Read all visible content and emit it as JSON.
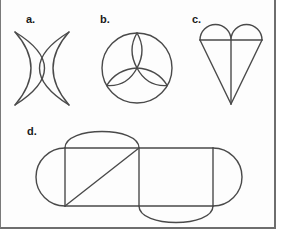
{
  "figures": [
    {
      "id": "a",
      "label": "a.",
      "shape": "two overlapping crescents"
    },
    {
      "id": "b",
      "label": "b.",
      "shape": "circle with inscribed trefoil of three lenses"
    },
    {
      "id": "c",
      "label": "c.",
      "shape": "heart composed of two semicircles over a triangle with center line"
    },
    {
      "id": "d",
      "label": "d.",
      "shape": "two squares with diagonal, flanked by four semicircles"
    }
  ],
  "colors": {
    "stroke": "#4a4a4a",
    "label": "#1a1a1a",
    "border": "#6e6e6e",
    "background": "#ffffff"
  }
}
